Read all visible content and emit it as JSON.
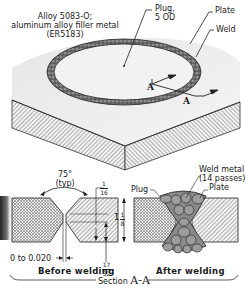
{
  "title": {
    "line1": "Alloy 5083-O;",
    "line2": "aluminum alloy filler metal",
    "line3": "(ER5183)"
  },
  "isometric_view": {
    "callouts": {
      "plug": "Plug,",
      "plug_size": "5 OD",
      "plate": "Plate",
      "weld": "Weld"
    },
    "section_markers": [
      "A",
      "A"
    ]
  },
  "before_welding": {
    "angle": "75°",
    "angle_note": "(typ)",
    "land_num": "1",
    "land_den": "16",
    "depth_num": "17",
    "depth_den": "32",
    "gap": "0 to 0.020",
    "caption": "Before welding"
  },
  "thickness": {
    "whole": "1",
    "num": "1",
    "den": "8"
  },
  "after_welding": {
    "weld_metal": "Weld metal",
    "passes": "(14 passes)",
    "plug": "Plug",
    "plate": "Plate",
    "pass_numbers": [
      "11",
      "10",
      "6",
      "3",
      "2",
      "1",
      "4",
      "5",
      "8",
      "9",
      "7",
      "12",
      "13",
      "14"
    ],
    "caption": "After welding"
  },
  "section_label": {
    "prefix": "Section",
    "id": "A-A"
  }
}
